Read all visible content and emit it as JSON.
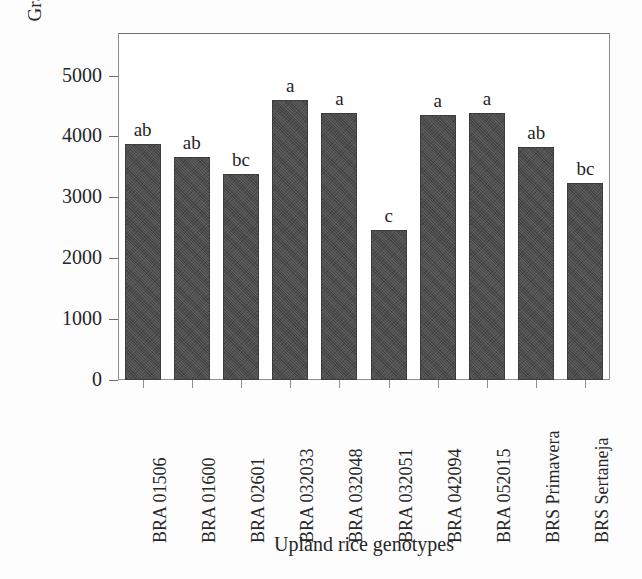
{
  "chart_data": {
    "type": "bar",
    "title": "",
    "xlabel": "Upland rice genotypes",
    "ylabel": "Grain yield (kg ha",
    "ylabel_superscript": "−1",
    "ylabel_suffix": ")",
    "categories": [
      "BRA 01506",
      "BRA 01600",
      "BRA 02601",
      "BRA 032033",
      "BRA 032048",
      "BRA 032051",
      "BRA 042094",
      "BRA 052015",
      "BRS Primavera",
      "BRS Sertaneja"
    ],
    "values": [
      3870,
      3670,
      3380,
      4600,
      4380,
      2470,
      4350,
      4390,
      3820,
      3240
    ],
    "annotations": [
      "ab",
      "ab",
      "bc",
      "a",
      "a",
      "c",
      "a",
      "a",
      "ab",
      "bc"
    ],
    "ytick_labels": [
      "5000",
      "4000",
      "3000",
      "2000",
      "1000",
      "0"
    ],
    "ytick_values": [
      5000,
      4000,
      3000,
      2000,
      1000,
      0
    ],
    "ylim": [
      0,
      5700
    ],
    "xlim_note": "categorical",
    "grid": false,
    "legend": false,
    "bar_color": "#4a4a4a",
    "axis_color": "#8e8e8e",
    "text_color": "#262626"
  }
}
